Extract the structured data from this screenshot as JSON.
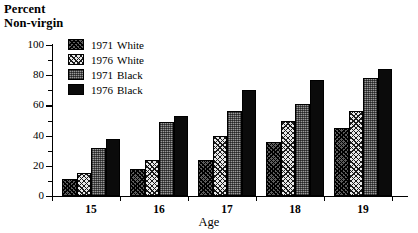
{
  "chart_data": {
    "type": "bar",
    "title": "",
    "ylabel": "Percent Non-virgin",
    "ylabel_lines": [
      "Percent",
      "Non-virgin"
    ],
    "xlabel": "Age",
    "categories": [
      "15",
      "16",
      "17",
      "18",
      "19"
    ],
    "ylim": [
      0,
      100
    ],
    "yticks": [
      0,
      20,
      40,
      60,
      80,
      100
    ],
    "yticks_minor": [
      10,
      30,
      50,
      70,
      90
    ],
    "grid": false,
    "legend_position": "top-left inside plot",
    "series": [
      {
        "name": "1971  White",
        "year": "1971",
        "race": "White",
        "pattern": "diagonal-crosshatch-dark",
        "values": [
          11,
          18,
          24,
          36,
          45
        ]
      },
      {
        "name": "1976  White",
        "year": "1976",
        "race": "White",
        "pattern": "diagonal-crosshatch-light",
        "values": [
          15,
          24,
          40,
          50,
          56
        ]
      },
      {
        "name": "1971  Black",
        "year": "1971",
        "race": "Black",
        "pattern": "gray-stipple",
        "values": [
          32,
          49,
          56,
          61,
          78
        ]
      },
      {
        "name": "1976  Black",
        "year": "1976",
        "race": "Black",
        "pattern": "solid-black",
        "values": [
          38,
          53,
          70,
          77,
          84
        ]
      }
    ]
  },
  "legend": {
    "items": [
      {
        "year": "1971",
        "race": "White"
      },
      {
        "year": "1976",
        "race": "White"
      },
      {
        "year": "1971",
        "race": "Black"
      },
      {
        "year": "1976",
        "race": "Black"
      }
    ]
  },
  "colors": {
    "axis": "#000000",
    "series_1971_white": "#5d5d5d",
    "series_1976_white": "#e8e8e8",
    "series_1971_black": "#9a9a9a",
    "series_1976_black": "#0b0b0b",
    "background": "#ffffff"
  }
}
